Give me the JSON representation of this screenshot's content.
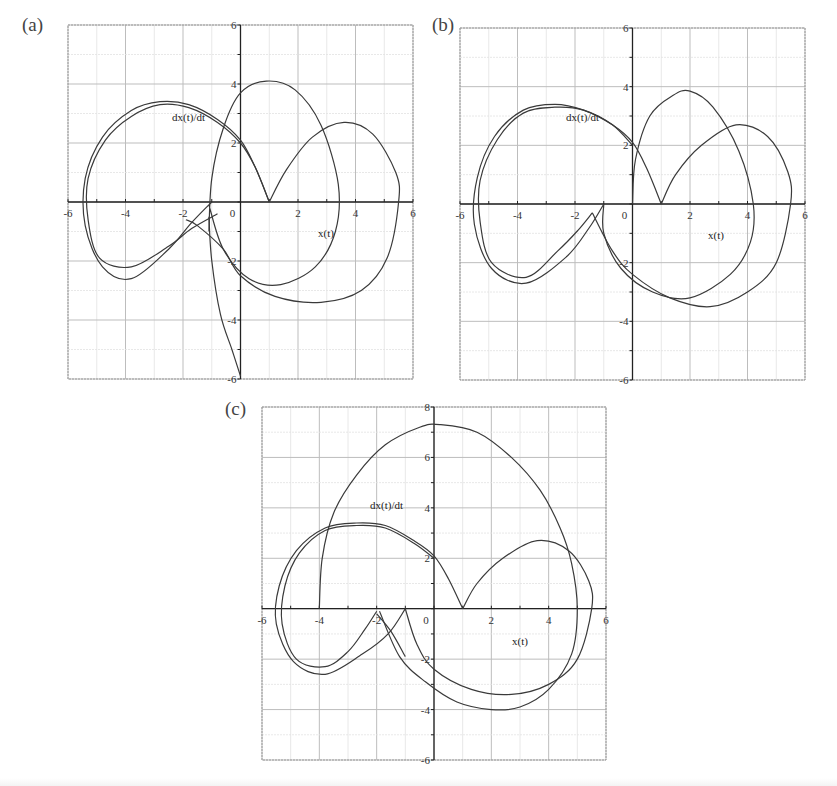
{
  "panels": [
    {
      "id": "a",
      "label": "(a)"
    },
    {
      "id": "b",
      "label": "(b)"
    },
    {
      "id": "c",
      "label": "(c)"
    }
  ],
  "axis_labels": {
    "x": "x(t)",
    "y": "dx(t)/dt"
  },
  "colors": {
    "curve": "#3a3a3a",
    "grid_major": "#bdbdbd",
    "grid_minor": "#e2e2e2",
    "axis": "#222222",
    "frame": "#9a9a9a"
  },
  "chart_data": [
    {
      "panel": "(a)",
      "type": "line",
      "title": "",
      "xlabel": "x(t)",
      "ylabel": "dx(t)/dt",
      "xlim": [
        -6,
        6
      ],
      "ylim": [
        -6,
        6
      ],
      "xticks": [
        -6,
        -4,
        -2,
        0,
        2,
        4,
        6
      ],
      "yticks": [
        -6,
        -4,
        -2,
        2,
        4,
        6
      ],
      "grid": true,
      "description": "Phase-plane trajectory: double outer loop on left (x from -5.5 to -1), cusp at (1,0), right lobe reaching x≈5.5, loop reaching y≈4.1, tail descending to (0,-6)",
      "series": [
        {
          "name": "outer-left-loop",
          "points": [
            [
              -1,
              0
            ],
            [
              -1.7,
              -0.7
            ],
            [
              -2.5,
              -1.6
            ],
            [
              -3.8,
              -2.6
            ],
            [
              -4.8,
              -2.2
            ],
            [
              -5.4,
              -0.8
            ],
            [
              -5.4,
              0.8
            ],
            [
              -4.8,
              2.2
            ],
            [
              -3.8,
              3.1
            ],
            [
              -2.8,
              3.4
            ],
            [
              -1.8,
              3.3
            ],
            [
              -0.8,
              2.8
            ],
            [
              0,
              2.1
            ],
            [
              0.5,
              1.2
            ],
            [
              1,
              0
            ]
          ]
        },
        {
          "name": "inner-left-loop",
          "points": [
            [
              -0.8,
              -0.4
            ],
            [
              -1.7,
              -0.9
            ],
            [
              -2.5,
              -1.5
            ],
            [
              -3.8,
              -2.2
            ],
            [
              -4.9,
              -1.9
            ],
            [
              -5.3,
              -0.6
            ],
            [
              -5.3,
              0.8
            ],
            [
              -4.7,
              2.1
            ],
            [
              -3.8,
              2.9
            ],
            [
              -2.8,
              3.3
            ],
            [
              -1.8,
              3.2
            ],
            [
              -0.8,
              2.7
            ],
            [
              0,
              2.0
            ],
            [
              0.5,
              1.2
            ],
            [
              1,
              0
            ]
          ]
        },
        {
          "name": "right-lobe",
          "points": [
            [
              1,
              0
            ],
            [
              1.6,
              1.1
            ],
            [
              2.5,
              2.2
            ],
            [
              3.6,
              2.7
            ],
            [
              4.6,
              2.3
            ],
            [
              5.4,
              1.0
            ],
            [
              5.5,
              0
            ],
            [
              5.1,
              -1.9
            ],
            [
              4.2,
              -3.0
            ],
            [
              2.8,
              -3.4
            ],
            [
              1.2,
              -3.2
            ],
            [
              0,
              -2.5
            ],
            [
              -0.6,
              -1.6
            ],
            [
              -1.5,
              -0.8
            ],
            [
              -1.9,
              -0.6
            ]
          ]
        },
        {
          "name": "upper-loop",
          "points": [
            [
              -1.1,
              -1.0
            ],
            [
              -1.0,
              0.8
            ],
            [
              -0.6,
              2.5
            ],
            [
              0,
              3.7
            ],
            [
              0.9,
              4.1
            ],
            [
              1.9,
              3.8
            ],
            [
              2.8,
              2.6
            ],
            [
              3.4,
              0.6
            ],
            [
              3.3,
              -1.0
            ],
            [
              2.6,
              -2.2
            ],
            [
              1.4,
              -2.8
            ],
            [
              0.3,
              -2.6
            ],
            [
              -0.6,
              -1.6
            ],
            [
              -1.1,
              -0.1
            ]
          ]
        },
        {
          "name": "tail",
          "points": [
            [
              -1.1,
              -0.5
            ],
            [
              -1.0,
              -2.0
            ],
            [
              -0.7,
              -3.8
            ],
            [
              -0.3,
              -5.0
            ],
            [
              0,
              -5.9
            ]
          ]
        }
      ]
    },
    {
      "panel": "(b)",
      "type": "line",
      "title": "",
      "xlabel": "x(t)",
      "ylabel": "dx(t)/dt",
      "xlim": [
        -6,
        6
      ],
      "ylim": [
        -6,
        6
      ],
      "xticks": [
        -6,
        -4,
        -2,
        0,
        2,
        4,
        6
      ],
      "yticks": [
        -6,
        -4,
        -2,
        2,
        4,
        6
      ],
      "grid": true,
      "description": "Phase-plane trajectory: triple left loop, cusp at (1,0), upper loop peaking near (2,3.8), right lobe reaching x≈5.5",
      "series": [
        {
          "name": "outer-left-loop",
          "points": [
            [
              -1,
              0
            ],
            [
              -1.5,
              -0.8
            ],
            [
              -2.3,
              -1.8
            ],
            [
              -3.7,
              -2.7
            ],
            [
              -4.9,
              -2.2
            ],
            [
              -5.5,
              -0.7
            ],
            [
              -5.4,
              0.9
            ],
            [
              -4.8,
              2.3
            ],
            [
              -3.8,
              3.2
            ],
            [
              -2.7,
              3.4
            ],
            [
              -1.7,
              3.2
            ],
            [
              -0.7,
              2.7
            ],
            [
              0,
              2.1
            ],
            [
              0.5,
              1.2
            ],
            [
              1,
              0
            ]
          ]
        },
        {
          "name": "inner-left-loop",
          "points": [
            [
              -1.4,
              -0.3
            ],
            [
              -1.9,
              -0.9
            ],
            [
              -2.6,
              -1.6
            ],
            [
              -3.7,
              -2.5
            ],
            [
              -4.9,
              -2.0
            ],
            [
              -5.3,
              -0.6
            ],
            [
              -5.3,
              0.8
            ],
            [
              -4.7,
              2.2
            ],
            [
              -3.8,
              3.1
            ],
            [
              -2.7,
              3.3
            ],
            [
              -1.7,
              3.2
            ],
            [
              -0.7,
              2.7
            ],
            [
              0,
              2.0
            ]
          ]
        },
        {
          "name": "right-lobe",
          "points": [
            [
              1,
              0
            ],
            [
              1.5,
              1.0
            ],
            [
              2.4,
              2.0
            ],
            [
              3.6,
              2.7
            ],
            [
              4.7,
              2.3
            ],
            [
              5.4,
              1.1
            ],
            [
              5.5,
              0
            ],
            [
              5.0,
              -2.0
            ],
            [
              4.0,
              -3.0
            ],
            [
              2.7,
              -3.5
            ],
            [
              1.3,
              -3.2
            ],
            [
              0,
              -2.4
            ],
            [
              -0.7,
              -1.6
            ],
            [
              -1.4,
              -0.3
            ]
          ]
        },
        {
          "name": "upper-loop",
          "points": [
            [
              0,
              0
            ],
            [
              0.1,
              1.5
            ],
            [
              0.6,
              3.0
            ],
            [
              1.4,
              3.7
            ],
            [
              2.0,
              3.85
            ],
            [
              2.8,
              3.3
            ],
            [
              3.7,
              1.8
            ],
            [
              4.2,
              0
            ],
            [
              4.1,
              -1.3
            ],
            [
              3.4,
              -2.4
            ],
            [
              2.0,
              -3.2
            ],
            [
              0.7,
              -3.0
            ],
            [
              -0.4,
              -2.2
            ],
            [
              -1.0,
              -1.0
            ],
            [
              -1.0,
              0
            ]
          ]
        }
      ]
    },
    {
      "panel": "(c)",
      "type": "line",
      "title": "",
      "xlabel": "x(t)",
      "ylabel": "dx(t)/dt",
      "xlim": [
        -6,
        6
      ],
      "ylim": [
        -6,
        8
      ],
      "xticks": [
        -6,
        -4,
        -2,
        0,
        2,
        4,
        6
      ],
      "yticks": [
        -6,
        -4,
        -2,
        2,
        4,
        6,
        8
      ],
      "grid": true,
      "description": "Phase-plane trajectory: double left loop, cusp at (1,0), large upper arc from (-4,0) peaking near (0.2,7.3) down to (5,0), lower arc reaching y≈-4",
      "series": [
        {
          "name": "outer-left-loop",
          "points": [
            [
              -1,
              0
            ],
            [
              -1.6,
              -1.0
            ],
            [
              -2.5,
              -1.8
            ],
            [
              -3.8,
              -2.6
            ],
            [
              -4.9,
              -2.1
            ],
            [
              -5.5,
              -0.6
            ],
            [
              -5.4,
              0.9
            ],
            [
              -4.8,
              2.3
            ],
            [
              -3.8,
              3.2
            ],
            [
              -2.7,
              3.4
            ],
            [
              -1.7,
              3.3
            ],
            [
              -0.7,
              2.7
            ],
            [
              0,
              2.1
            ],
            [
              0.5,
              1.2
            ],
            [
              1,
              0
            ]
          ]
        },
        {
          "name": "inner-left-loop",
          "points": [
            [
              -2,
              -0.1
            ],
            [
              -2.4,
              -0.8
            ],
            [
              -3.0,
              -1.7
            ],
            [
              -3.8,
              -2.3
            ],
            [
              -4.8,
              -2.0
            ],
            [
              -5.3,
              -0.6
            ],
            [
              -5.2,
              0.9
            ],
            [
              -4.7,
              2.2
            ],
            [
              -3.8,
              3.1
            ],
            [
              -2.7,
              3.3
            ],
            [
              -1.7,
              3.2
            ],
            [
              -0.7,
              2.6
            ],
            [
              0,
              2.0
            ]
          ]
        },
        {
          "name": "right-lobe",
          "points": [
            [
              1,
              0
            ],
            [
              1.5,
              1.0
            ],
            [
              2.4,
              2.0
            ],
            [
              3.6,
              2.7
            ],
            [
              4.7,
              2.3
            ],
            [
              5.4,
              1.1
            ],
            [
              5.5,
              0
            ],
            [
              5.0,
              -2.0
            ],
            [
              4.0,
              -3.0
            ],
            [
              2.7,
              -3.4
            ],
            [
              1.3,
              -3.2
            ],
            [
              0,
              -2.4
            ],
            [
              -0.6,
              -1.4
            ],
            [
              -1.0,
              0
            ]
          ]
        },
        {
          "name": "big-upper-arc",
          "points": [
            [
              -4,
              0
            ],
            [
              -3.9,
              2.0
            ],
            [
              -3.5,
              3.8
            ],
            [
              -2.7,
              5.3
            ],
            [
              -1.7,
              6.5
            ],
            [
              -0.5,
              7.2
            ],
            [
              0.2,
              7.3
            ],
            [
              1.5,
              7.0
            ],
            [
              2.7,
              6.0
            ],
            [
              3.7,
              4.7
            ],
            [
              4.4,
              3.2
            ],
            [
              4.8,
              1.8
            ],
            [
              5.0,
              0
            ],
            [
              4.8,
              -1.8
            ],
            [
              4.0,
              -3.2
            ],
            [
              3.0,
              -3.9
            ],
            [
              2.0,
              -4.0
            ],
            [
              0.8,
              -3.7
            ],
            [
              -0.3,
              -2.9
            ],
            [
              -1.2,
              -1.9
            ],
            [
              -1.9,
              -0.1
            ]
          ]
        },
        {
          "name": "left-cusp-arc",
          "points": [
            [
              -2,
              -0.2
            ],
            [
              -1.5,
              -0.9
            ],
            [
              -1.0,
              -1.9
            ]
          ]
        }
      ]
    }
  ]
}
